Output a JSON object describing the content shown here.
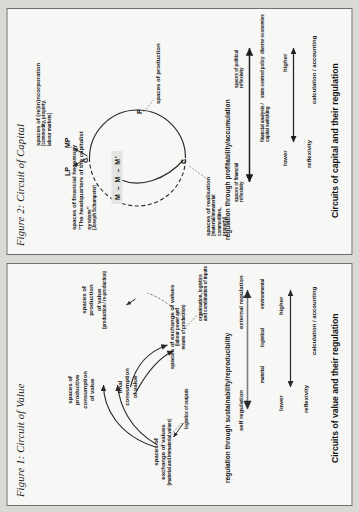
{
  "page": {
    "background_color": "#d9d9d6",
    "panel_color": "#f7f7f5",
    "ink_color": "#161616"
  },
  "figure1": {
    "caption": "Figure 1: Circuit of Value",
    "bottom_title": "Circuits of value and their regulation",
    "nodes": [
      {
        "id": "exchange-values-material",
        "label": "spaces of\nexchange of values",
        "sublabel": "(material and immaterial values)"
      },
      {
        "id": "productive-consumption",
        "label": "spaces of\nproductive\nconsumption\nof value",
        "sublabel": ""
      },
      {
        "id": "final-consumption",
        "label": "final\nconsumption\nof value",
        "sublabel": ""
      },
      {
        "id": "exchange-values-labour",
        "label": "spaces of exchange of values",
        "sublabel": "(labour power and\nmeans of production)"
      },
      {
        "id": "production-of-value",
        "label": "spaces of\nproduction\nof value",
        "sublabel": "(production / re-production)"
      }
    ],
    "annotations": [
      {
        "id": "logistics-outputs",
        "text": "logistics of outputs"
      },
      {
        "id": "organisation-logistics-inputs",
        "text": "organisation, logistics\nand combination of inputs"
      }
    ],
    "regulation": {
      "header": "regulation through sustainability/reproducibility",
      "left_end": "self regulation",
      "right_end": "external regulation"
    },
    "scale": {
      "axis_label": "reflexivity",
      "low": "lower",
      "high": "higher",
      "items": [
        "material",
        "logistical",
        "environmental"
      ],
      "outcome": "calculation / accounting"
    }
  },
  "figure2": {
    "caption": "Figure 2: Circuit of Capital",
    "bottom_title": "Circuits of capital and their regulation",
    "money_box": "M – M – M'",
    "nodes": [
      {
        "id": "financial-hegemony",
        "label": "spaces of financial hegemony",
        "quote": "\"The headquarters of the capitalist system\"",
        "attribution": "(Joseph Schumpeter)"
      },
      {
        "id": "reincorporation",
        "label": "spaces of (re)in)ncorporation",
        "sublabel": "[commodity, property,\nlabour markets]"
      },
      {
        "id": "realisation",
        "label": "spaces of realisation",
        "sublabel": "[material/immaterial\ncommodities,\nproperty]"
      },
      {
        "id": "production",
        "label": "spaces of production",
        "sublabel": ""
      }
    ],
    "circuit_letters": [
      "C",
      "C",
      "P",
      "LP",
      "MP"
    ],
    "regulation": {
      "header": "regulation through profitability/accumulation",
      "left_end": "spaces of financial\nreflexivity",
      "right_end": "spaces of political\nreflexivity"
    },
    "scale": {
      "axis_label": "reflexivity",
      "low": "lower",
      "high": "higher",
      "items": [
        "financial analysis /\ncapital switching",
        "state-centred policy",
        "diverse economies"
      ],
      "outcome": "calculation / accounting"
    }
  }
}
